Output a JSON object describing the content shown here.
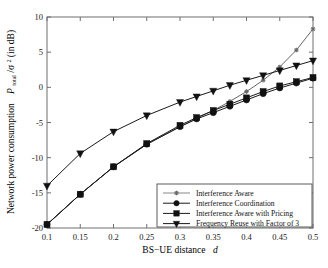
{
  "figure": {
    "background": "#ffffff",
    "axis_color": "#6f6f6f",
    "line_color": "#555555",
    "marker_color": "#111111"
  },
  "axes": {
    "xlabel_prefix": "BS−UE distance",
    "xlabel_var": "d",
    "ylabel_text": "Network power consumption",
    "ylabel_var": "P",
    "ylabel_sub": "total",
    "ylabel_denom": "/σ",
    "ylabel_sup": "2",
    "ylabel_unit": " (in dB)",
    "xticks": [
      "0.1",
      "0.15",
      "0.2",
      "0.25",
      "0.3",
      "0.35",
      "0.4",
      "0.45",
      "0.5"
    ],
    "yticks": [
      "10",
      "5",
      "0",
      "-5",
      "-10",
      "-15",
      "-20"
    ],
    "xlim": [
      0.1,
      0.5
    ],
    "ylim": [
      -20,
      10
    ],
    "grid": false
  },
  "legend": {
    "position": "bottom-right-inside",
    "items": [
      {
        "label": "Interference Aware",
        "marker": "star",
        "color": "#6a6a6a"
      },
      {
        "label": "Interference Coordination",
        "marker": "circle",
        "color": "#111111"
      },
      {
        "label": "Interference Aware with Pricing",
        "marker": "square",
        "color": "#111111"
      },
      {
        "label": "Frequency Reuse with Factor of 3",
        "marker": "triangle-down",
        "color": "#111111"
      }
    ]
  },
  "chart_data": {
    "type": "line",
    "title": "",
    "xlabel": "BS−UE distance  d",
    "ylabel": "Network power consumption  P_total/σ² (in dB)",
    "xlim": [
      0.1,
      0.5
    ],
    "ylim": [
      -20,
      10
    ],
    "xticks": [
      0.1,
      0.15,
      0.2,
      0.25,
      0.3,
      0.35,
      0.4,
      0.45,
      0.5
    ],
    "yticks": [
      -20,
      -15,
      -10,
      -5,
      0,
      5,
      10
    ],
    "grid": false,
    "legend_position": "lower right",
    "x": [
      0.1,
      0.15,
      0.2,
      0.25,
      0.3,
      0.325,
      0.35,
      0.375,
      0.4,
      0.425,
      0.45,
      0.475,
      0.5
    ],
    "series": [
      {
        "name": "Interference Aware",
        "marker": "star",
        "color": "#6a6a6a",
        "values": [
          -19.5,
          -15.2,
          -11.3,
          -8.1,
          -5.6,
          -4.4,
          -3.3,
          -2.0,
          -0.6,
          1.0,
          2.9,
          5.3,
          8.3
        ]
      },
      {
        "name": "Interference Coordination",
        "marker": "circle",
        "color": "#111111",
        "values": [
          -19.5,
          -15.2,
          -11.3,
          -8.1,
          -5.6,
          -4.5,
          -3.6,
          -2.7,
          -1.8,
          -0.9,
          -0.1,
          0.6,
          1.3
        ]
      },
      {
        "name": "Interference Aware with Pricing",
        "marker": "square",
        "color": "#111111",
        "values": [
          -19.5,
          -15.2,
          -11.3,
          -8.0,
          -5.4,
          -4.3,
          -3.3,
          -2.4,
          -1.5,
          -0.6,
          0.2,
          0.8,
          1.4
        ]
      },
      {
        "name": "Frequency Reuse with Factor of 3",
        "marker": "triangle-down",
        "color": "#111111",
        "values": [
          -14.0,
          -9.4,
          -6.3,
          -4.0,
          -2.1,
          -1.3,
          -0.5,
          0.3,
          1.0,
          1.7,
          2.4,
          3.1,
          3.8
        ]
      }
    ]
  }
}
